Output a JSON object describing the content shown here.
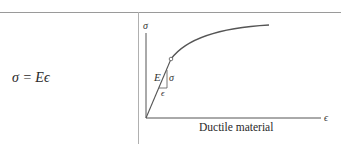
{
  "formula": {
    "text": "σ = Eϵ"
  },
  "diagram": {
    "title": "Ductile material",
    "axes": {
      "y_label": "σ",
      "x_label": "ϵ"
    },
    "annotations": {
      "slope_label": "E",
      "rise_label": "σ",
      "run_label": "ϵ"
    },
    "curve": {
      "description": "Linear elastic region from origin to proportional limit (marked with open circle), followed by concave-down hardening curve leveling off",
      "color": "#555555"
    }
  }
}
